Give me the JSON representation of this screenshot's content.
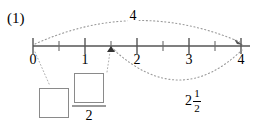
{
  "figure": {
    "problem_number": "(1)",
    "number_line": {
      "min": 0,
      "max": 4,
      "major_ticks": [
        0,
        1,
        2,
        3,
        4
      ],
      "major_tick_labels": [
        "0",
        "1",
        "2",
        "3",
        "4"
      ],
      "minor_ticks": [
        0.5,
        1.5,
        2.5,
        3.5
      ],
      "axis_color": "#555555"
    },
    "arcs": [
      {
        "name": "top-arc",
        "from": 0,
        "to": 4,
        "label": "4",
        "direction": "above",
        "style": "dotted",
        "color": "#9a9a9a"
      },
      {
        "name": "bottom-arc",
        "from": 1.5,
        "to": 4,
        "label_whole": "2",
        "label_numerator": "1",
        "label_denominator": "2",
        "direction": "below",
        "style": "dotted",
        "color": "#9a9a9a"
      }
    ],
    "marked_point": {
      "value": 1.5,
      "label": "arrow marker on number line"
    },
    "answer": {
      "whole_box_value": "",
      "fraction_numerator_value": "",
      "fraction_denominator": "2",
      "box_border_color": "#8a8a8a"
    }
  }
}
